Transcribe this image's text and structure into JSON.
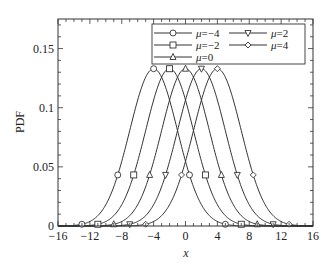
{
  "chart_data": {
    "type": "line",
    "title": "",
    "xlabel": "x",
    "ylabel": "PDF",
    "xlim": [
      -16,
      16
    ],
    "ylim": [
      0,
      0.175
    ],
    "xticks": [
      -16,
      -12,
      -8,
      -4,
      0,
      4,
      8,
      12,
      16
    ],
    "xtick_labels": [
      "−16",
      "−12",
      "−8",
      "−4",
      "0",
      "4",
      "8",
      "12",
      "16"
    ],
    "yticks": [
      0,
      0.05,
      0.1,
      0.15
    ],
    "ytick_labels": [
      "0",
      "0.05",
      "0.1",
      "0.15"
    ],
    "grid": false,
    "legend_position": "upper right",
    "sigma": 3,
    "marker_offsets": [
      -9,
      -4.5,
      0,
      4.5,
      9
    ],
    "series": [
      {
        "name": "μ = −4",
        "mu": -4,
        "marker": "circle"
      },
      {
        "name": "μ = −2",
        "mu": -2,
        "marker": "square"
      },
      {
        "name": "μ = 0",
        "mu": 0,
        "marker": "triangle-up"
      },
      {
        "name": "μ = 2",
        "mu": 2,
        "marker": "triangle-down"
      },
      {
        "name": "μ = 4",
        "mu": 4,
        "marker": "diamond"
      }
    ],
    "peak_value": 0.133
  },
  "colors": {
    "line": "#333333",
    "axis": "#333333",
    "background": "#ffffff"
  }
}
